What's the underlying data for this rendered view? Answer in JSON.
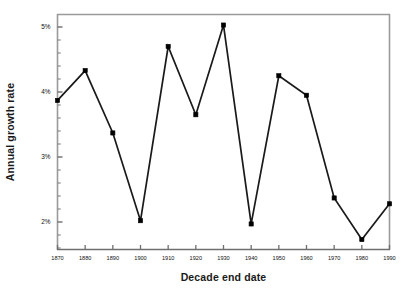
{
  "chart_data": {
    "type": "line",
    "title": "",
    "xlabel": "Decade end date",
    "ylabel": "Annual growth rate",
    "x": [
      1870,
      1880,
      1890,
      1900,
      1910,
      1920,
      1930,
      1940,
      1950,
      1960,
      1970,
      1980,
      1990
    ],
    "values": [
      3.87,
      4.33,
      3.37,
      2.02,
      4.7,
      3.65,
      5.03,
      1.97,
      4.25,
      3.95,
      2.37,
      1.73,
      2.28
    ],
    "series": [
      {
        "name": "Annual growth rate",
        "values": [
          3.87,
          4.33,
          3.37,
          2.02,
          4.7,
          3.65,
          5.03,
          1.97,
          4.25,
          3.95,
          2.37,
          1.73,
          2.28
        ]
      }
    ],
    "x_tick_labels": [
      "1870",
      "1880",
      "1890",
      "1900",
      "1910",
      "1920",
      "1930",
      "1940",
      "1950",
      "1960",
      "1970",
      "1980",
      "1990"
    ],
    "y_tick_labels": [
      "5%",
      "4%",
      "3%",
      "2%"
    ],
    "y_tick_values": [
      5,
      4,
      3,
      2
    ],
    "y_minor_tick_values": [
      5.2,
      4.8,
      4.6,
      4.4,
      4.2,
      3.8,
      3.6,
      3.4,
      3.2,
      2.8,
      2.6,
      2.4,
      2.2,
      1.8,
      1.6
    ],
    "xlim": [
      1865,
      1995
    ],
    "ylim": [
      1.6,
      5.3
    ],
    "grid": false,
    "legend": "none",
    "marker": "filled-square",
    "line_color": "#1a1a1a",
    "marker_color": "#000000",
    "frame_color": "#808080",
    "background_color": "#ffffff"
  },
  "axes": {
    "x_title": "Decade end date",
    "y_title": "Annual growth rate"
  }
}
